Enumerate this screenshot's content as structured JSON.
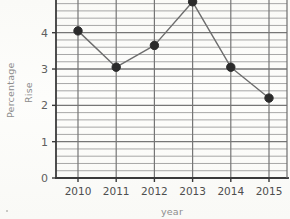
{
  "chart_data": {
    "type": "line",
    "title": "",
    "xlabel": "year",
    "ylabel": "Percentage Rise",
    "ylabel_line1": "Percentage",
    "ylabel_line2": "Rise",
    "categories": [
      "2010",
      "2011",
      "2012",
      "2013",
      "2014",
      "2015"
    ],
    "x": [
      2010,
      2011,
      2012,
      2013,
      2014,
      2015
    ],
    "values": [
      4.05,
      3.05,
      3.65,
      4.85,
      3.05,
      2.2
    ],
    "series": [
      {
        "name": "Percentage Rise",
        "values": [
          4.05,
          3.05,
          3.65,
          4.85,
          3.05,
          2.2
        ]
      }
    ],
    "point_labels": [
      "4.05",
      "3.05",
      "3.65",
      "4.85",
      "3.05",
      "2.2"
    ],
    "ylim": [
      0,
      4.9
    ],
    "xlim": [
      2009.45,
      2015.55
    ],
    "ytick_labels": [
      "0",
      "1",
      "2",
      "3",
      "4"
    ],
    "ytick_values": [
      0,
      1,
      2,
      3,
      4
    ],
    "xtick_labels": [
      "2010",
      "2011",
      "2012",
      "2013",
      "2014",
      "2015"
    ],
    "minor_gridlines_per_unit": 5,
    "grid": true,
    "grid_minor": true,
    "legend": false,
    "legend_position": "none",
    "marker": "filled-circle",
    "note_top_point_clipped": "2013 marker is clipped by the top edge of the image"
  },
  "style": {
    "line_color": "#6d6d6d",
    "marker_color": "#2b2b2b",
    "axis_color": "#3a3a3a",
    "major_grid_color": "#767676",
    "minor_grid_color": "#9d9d9d",
    "tick_label_color": "#4e4e4e",
    "axis_title_color": "#8d8d8d",
    "background_color": "#fbfbf9"
  }
}
